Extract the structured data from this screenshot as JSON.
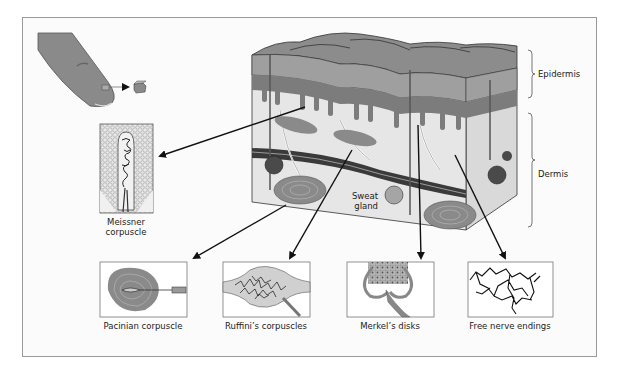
{
  "figure": {
    "type": "diagram"
  },
  "labels": {
    "epidermis": "Epidermis",
    "dermis": "Dermis",
    "sweat_gland": "Sweat gland",
    "meissner": "Meissner corpuscle",
    "meissner_line1": "Meissner",
    "meissner_line2": "corpuscle",
    "sweat_line1": "Sweat",
    "sweat_line2": "gland"
  },
  "panels": [
    {
      "id": "pacinian",
      "label": "Pacinian corpuscle"
    },
    {
      "id": "ruffini",
      "label": "Ruffini’s corpuscles"
    },
    {
      "id": "merkel",
      "label": "Merkel’s disks"
    },
    {
      "id": "free",
      "label": "Free nerve endings"
    }
  ],
  "colors": {
    "frame_border": "#9a9a9a",
    "skin_dark": "#6f6f6f",
    "skin_mid": "#9a9a9a",
    "skin_light": "#c8c8c8",
    "dermis_fill": "#e6e6e6",
    "ink": "#1a1a1a"
  }
}
